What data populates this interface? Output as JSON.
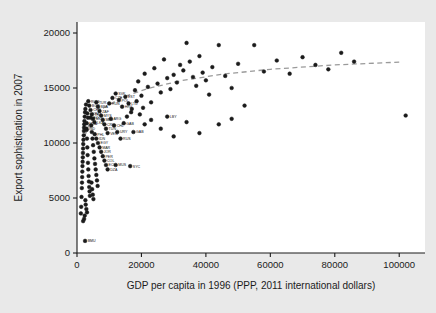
{
  "figure": {
    "background_color": "#e9e9e9",
    "plot_background_color": "#ffffff",
    "frame_color": "#1b1b1b",
    "marker_color": "#1b1b1b",
    "trend_color": "#9a9a9a"
  },
  "chart_data": {
    "type": "scatter",
    "title": "",
    "xlabel": "GDP per capita in 1996 (PPP, 2011 international dollars)",
    "ylabel": "Export sophistication in 2007",
    "xlim": [
      0,
      108000
    ],
    "ylim": [
      0,
      21000
    ],
    "xticks": [
      0,
      20000,
      40000,
      60000,
      80000,
      100000
    ],
    "xticklabels": [
      "0",
      "20000",
      "40000",
      "60000",
      "80000",
      "100000"
    ],
    "yticks": [
      0,
      5000,
      10000,
      15000,
      20000
    ],
    "yticklabels": [
      "0",
      "5000",
      "10000",
      "15000",
      "20000"
    ],
    "grid": false,
    "legend": "none",
    "marker_style": "filled-circle",
    "marker_size": 2.6,
    "series": [
      {
        "name": "Countries",
        "points": [
          {
            "x": 1200,
            "y": 3600,
            "label": ""
          },
          {
            "x": 1300,
            "y": 4200,
            "label": ""
          },
          {
            "x": 1400,
            "y": 5100,
            "label": ""
          },
          {
            "x": 1500,
            "y": 5900,
            "label": ""
          },
          {
            "x": 1550,
            "y": 6400,
            "label": ""
          },
          {
            "x": 1600,
            "y": 6900,
            "label": ""
          },
          {
            "x": 1650,
            "y": 7400,
            "label": ""
          },
          {
            "x": 1700,
            "y": 7900,
            "label": ""
          },
          {
            "x": 1750,
            "y": 8300,
            "label": ""
          },
          {
            "x": 1800,
            "y": 8700,
            "label": ""
          },
          {
            "x": 1850,
            "y": 9100,
            "label": ""
          },
          {
            "x": 1900,
            "y": 9500,
            "label": ""
          },
          {
            "x": 1950,
            "y": 9900,
            "label": ""
          },
          {
            "x": 2000,
            "y": 10300,
            "label": ""
          },
          {
            "x": 2100,
            "y": 10700,
            "label": ""
          },
          {
            "x": 2150,
            "y": 11100,
            "label": ""
          },
          {
            "x": 2200,
            "y": 11400,
            "label": ""
          },
          {
            "x": 2250,
            "y": 11700,
            "label": ""
          },
          {
            "x": 2300,
            "y": 12000,
            "label": ""
          },
          {
            "x": 2400,
            "y": 12400,
            "label": ""
          },
          {
            "x": 2500,
            "y": 12800,
            "label": ""
          },
          {
            "x": 2600,
            "y": 13100,
            "label": ""
          },
          {
            "x": 2800,
            "y": 13500,
            "label": ""
          },
          {
            "x": 3000,
            "y": 11200,
            "label": ""
          },
          {
            "x": 3100,
            "y": 10400,
            "label": ""
          },
          {
            "x": 3200,
            "y": 9600,
            "label": ""
          },
          {
            "x": 3300,
            "y": 8900,
            "label": ""
          },
          {
            "x": 3400,
            "y": 8200,
            "label": ""
          },
          {
            "x": 3500,
            "y": 7600,
            "label": ""
          },
          {
            "x": 3600,
            "y": 7000,
            "label": ""
          },
          {
            "x": 3700,
            "y": 6500,
            "label": ""
          },
          {
            "x": 3800,
            "y": 6000,
            "label": ""
          },
          {
            "x": 3900,
            "y": 5600,
            "label": ""
          },
          {
            "x": 4000,
            "y": 5200,
            "label": ""
          },
          {
            "x": 2600,
            "y": 4800,
            "label": ""
          },
          {
            "x": 2700,
            "y": 4400,
            "label": ""
          },
          {
            "x": 2900,
            "y": 4000,
            "label": ""
          },
          {
            "x": 3100,
            "y": 3700,
            "label": ""
          },
          {
            "x": 2400,
            "y": 3400,
            "label": ""
          },
          {
            "x": 2200,
            "y": 3100,
            "label": ""
          },
          {
            "x": 1900,
            "y": 2900,
            "label": ""
          },
          {
            "x": 4200,
            "y": 12300,
            "label": ""
          },
          {
            "x": 4400,
            "y": 11600,
            "label": ""
          },
          {
            "x": 4600,
            "y": 11000,
            "label": ""
          },
          {
            "x": 4800,
            "y": 10400,
            "label": ""
          },
          {
            "x": 5000,
            "y": 9800,
            "label": ""
          },
          {
            "x": 5200,
            "y": 9200,
            "label": ""
          },
          {
            "x": 5400,
            "y": 8600,
            "label": ""
          },
          {
            "x": 5600,
            "y": 8100,
            "label": ""
          },
          {
            "x": 5800,
            "y": 7600,
            "label": ""
          },
          {
            "x": 6000,
            "y": 7100,
            "label": ""
          },
          {
            "x": 6200,
            "y": 6600,
            "label": ""
          },
          {
            "x": 6400,
            "y": 6100,
            "label": ""
          },
          {
            "x": 4500,
            "y": 6400,
            "label": ""
          },
          {
            "x": 4700,
            "y": 5800,
            "label": ""
          },
          {
            "x": 4900,
            "y": 5300,
            "label": ""
          },
          {
            "x": 5100,
            "y": 4900,
            "label": ""
          },
          {
            "x": 3500,
            "y": 13800,
            "label": "ROM"
          },
          {
            "x": 3800,
            "y": 13400,
            "label": "BGR"
          },
          {
            "x": 4200,
            "y": 13000,
            "label": "CHN"
          },
          {
            "x": 4600,
            "y": 12600,
            "label": "THA"
          },
          {
            "x": 5000,
            "y": 12200,
            "label": "MKD"
          },
          {
            "x": 5400,
            "y": 11900,
            "label": "LKA"
          },
          {
            "x": 3200,
            "y": 12700,
            "label": "UKR"
          },
          {
            "x": 3400,
            "y": 12300,
            "label": "GEO"
          },
          {
            "x": 3000,
            "y": 11800,
            "label": "MDA"
          },
          {
            "x": 2900,
            "y": 11300,
            "label": "IND"
          },
          {
            "x": 6000,
            "y": 13700,
            "label": "TUR"
          },
          {
            "x": 6500,
            "y": 13300,
            "label": "BRA"
          },
          {
            "x": 7000,
            "y": 12900,
            "label": "ZAF"
          },
          {
            "x": 7500,
            "y": 12500,
            "label": "MYS"
          },
          {
            "x": 8000,
            "y": 12100,
            "label": "MEX"
          },
          {
            "x": 8500,
            "y": 11700,
            "label": "CRI"
          },
          {
            "x": 9000,
            "y": 11300,
            "label": "TUN"
          },
          {
            "x": 5500,
            "y": 10800,
            "label": "PHL"
          },
          {
            "x": 6000,
            "y": 10400,
            "label": "IDN"
          },
          {
            "x": 6500,
            "y": 10000,
            "label": "EGY"
          },
          {
            "x": 7000,
            "y": 9600,
            "label": "MAR"
          },
          {
            "x": 7500,
            "y": 9200,
            "label": "JOR"
          },
          {
            "x": 8000,
            "y": 8800,
            "label": "PER"
          },
          {
            "x": 8500,
            "y": 8400,
            "label": "COL"
          },
          {
            "x": 9000,
            "y": 8000,
            "label": "ECU"
          },
          {
            "x": 9500,
            "y": 7600,
            "label": "DZA"
          },
          {
            "x": 10000,
            "y": 13600,
            "label": "HUN"
          },
          {
            "x": 11000,
            "y": 14100,
            "label": "CZE"
          },
          {
            "x": 12000,
            "y": 14500,
            "label": "SVK"
          },
          {
            "x": 13000,
            "y": 13900,
            "label": "POL"
          },
          {
            "x": 14000,
            "y": 13300,
            "label": "HRV"
          },
          {
            "x": 15000,
            "y": 14200,
            "label": "EST"
          },
          {
            "x": 16000,
            "y": 13600,
            "label": "LTU"
          },
          {
            "x": 10500,
            "y": 12200,
            "label": "ARG"
          },
          {
            "x": 11500,
            "y": 11600,
            "label": "CHL"
          },
          {
            "x": 12500,
            "y": 11000,
            "label": "URY"
          },
          {
            "x": 13500,
            "y": 10400,
            "label": "RUS"
          },
          {
            "x": 9500,
            "y": 10900,
            "label": "VEN"
          },
          {
            "x": 14500,
            "y": 11800,
            "label": "GAB"
          },
          {
            "x": 17500,
            "y": 11000,
            "label": "GAB"
          },
          {
            "x": 12000,
            "y": 8000,
            "label": "MUS"
          },
          {
            "x": 16500,
            "y": 7900,
            "label": "SYC"
          },
          {
            "x": 2500,
            "y": 1100,
            "label": "BMU"
          },
          {
            "x": 18000,
            "y": 14800,
            "label": ""
          },
          {
            "x": 19000,
            "y": 15600,
            "label": ""
          },
          {
            "x": 20000,
            "y": 14300,
            "label": ""
          },
          {
            "x": 21000,
            "y": 16300,
            "label": ""
          },
          {
            "x": 22000,
            "y": 15100,
            "label": ""
          },
          {
            "x": 23000,
            "y": 13700,
            "label": ""
          },
          {
            "x": 24000,
            "y": 16800,
            "label": ""
          },
          {
            "x": 25000,
            "y": 15400,
            "label": ""
          },
          {
            "x": 26000,
            "y": 14600,
            "label": ""
          },
          {
            "x": 27000,
            "y": 17600,
            "label": ""
          },
          {
            "x": 28000,
            "y": 15900,
            "label": ""
          },
          {
            "x": 29000,
            "y": 14900,
            "label": ""
          },
          {
            "x": 30000,
            "y": 16200,
            "label": ""
          },
          {
            "x": 31000,
            "y": 15500,
            "label": ""
          },
          {
            "x": 32000,
            "y": 17100,
            "label": ""
          },
          {
            "x": 33000,
            "y": 16600,
            "label": ""
          },
          {
            "x": 34000,
            "y": 19100,
            "label": ""
          },
          {
            "x": 35000,
            "y": 17400,
            "label": ""
          },
          {
            "x": 36000,
            "y": 16000,
            "label": ""
          },
          {
            "x": 37000,
            "y": 15200,
            "label": ""
          },
          {
            "x": 38000,
            "y": 17900,
            "label": ""
          },
          {
            "x": 39000,
            "y": 16400,
            "label": ""
          },
          {
            "x": 40000,
            "y": 15700,
            "label": ""
          },
          {
            "x": 41000,
            "y": 14400,
            "label": ""
          },
          {
            "x": 42000,
            "y": 16900,
            "label": ""
          },
          {
            "x": 44000,
            "y": 18900,
            "label": ""
          },
          {
            "x": 46000,
            "y": 16100,
            "label": ""
          },
          {
            "x": 48000,
            "y": 15000,
            "label": ""
          },
          {
            "x": 50000,
            "y": 17200,
            "label": ""
          },
          {
            "x": 52000,
            "y": 13400,
            "label": ""
          },
          {
            "x": 55000,
            "y": 18900,
            "label": ""
          },
          {
            "x": 58000,
            "y": 16500,
            "label": ""
          },
          {
            "x": 62000,
            "y": 17500,
            "label": ""
          },
          {
            "x": 66000,
            "y": 16300,
            "label": ""
          },
          {
            "x": 70000,
            "y": 17800,
            "label": ""
          },
          {
            "x": 74000,
            "y": 17100,
            "label": ""
          },
          {
            "x": 78000,
            "y": 16700,
            "label": ""
          },
          {
            "x": 82000,
            "y": 18200,
            "label": ""
          },
          {
            "x": 86000,
            "y": 17400,
            "label": ""
          },
          {
            "x": 102000,
            "y": 12500,
            "label": ""
          },
          {
            "x": 19500,
            "y": 12600,
            "label": ""
          },
          {
            "x": 23000,
            "y": 12100,
            "label": ""
          },
          {
            "x": 26000,
            "y": 11300,
            "label": ""
          },
          {
            "x": 30000,
            "y": 10600,
            "label": ""
          },
          {
            "x": 34000,
            "y": 11900,
            "label": ""
          },
          {
            "x": 38000,
            "y": 10900,
            "label": ""
          },
          {
            "x": 21000,
            "y": 11700,
            "label": ""
          },
          {
            "x": 28000,
            "y": 12400,
            "label": "LBY"
          },
          {
            "x": 44000,
            "y": 11700,
            "label": ""
          },
          {
            "x": 48000,
            "y": 12200,
            "label": ""
          },
          {
            "x": 17000,
            "y": 13100,
            "label": ""
          },
          {
            "x": 18500,
            "y": 13800,
            "label": ""
          },
          {
            "x": 20500,
            "y": 13200,
            "label": ""
          },
          {
            "x": 15500,
            "y": 12400,
            "label": ""
          },
          {
            "x": 16800,
            "y": 12800,
            "label": ""
          }
        ]
      }
    ],
    "trendline": {
      "style": "dashed",
      "color": "#9a9a9a",
      "description": "logarithmic fit",
      "points": [
        {
          "x": 1500,
          "y": 9900
        },
        {
          "x": 4000,
          "y": 11900
        },
        {
          "x": 8000,
          "y": 13150
        },
        {
          "x": 14000,
          "y": 14150
        },
        {
          "x": 22000,
          "y": 14950
        },
        {
          "x": 32000,
          "y": 15650
        },
        {
          "x": 45000,
          "y": 16250
        },
        {
          "x": 60000,
          "y": 16700
        },
        {
          "x": 80000,
          "y": 17100
        },
        {
          "x": 100000,
          "y": 17350
        }
      ]
    }
  }
}
